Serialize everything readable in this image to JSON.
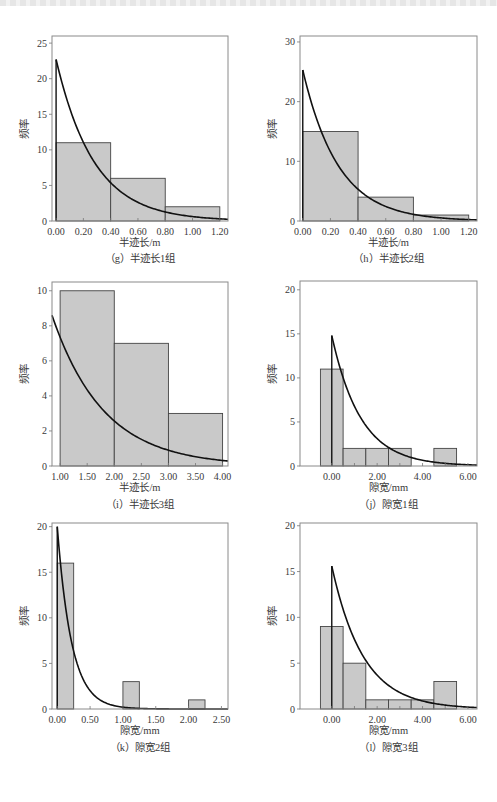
{
  "figure": {
    "ylabel": "频率",
    "panels_count": 6
  },
  "chart_data": [
    {
      "id": "g",
      "type": "bar",
      "title": "(g) 半迹长1组",
      "caption": "（g）半迹长1组",
      "xlabel": "半迹长/m",
      "ylabel": "频率",
      "xlim": [
        -0.03,
        1.26
      ],
      "ylim": [
        0,
        26
      ],
      "xticks": [
        0.0,
        0.2,
        0.4,
        0.6,
        0.8,
        1.0,
        1.2
      ],
      "xtick_labels": [
        "0.00",
        "0.20",
        "0.40",
        "0.60",
        "0.80",
        "1.00",
        "1.20"
      ],
      "yticks": [
        0,
        5,
        10,
        15,
        20,
        25
      ],
      "bins": [
        [
          0.0,
          0.4
        ],
        [
          0.4,
          0.8
        ],
        [
          0.8,
          1.2
        ]
      ],
      "values": [
        11,
        6,
        2
      ],
      "fit_curve": {
        "type": "exponential",
        "start_x": 0.0,
        "peak": 22.7,
        "rate": 3.6,
        "vertical_line_at": 0.0
      },
      "frame": {
        "x": 52,
        "y": 36,
        "w": 176,
        "h": 185
      },
      "caption_y": 262,
      "xlabel_y": 246
    },
    {
      "id": "h",
      "type": "bar",
      "title": "(h) 半迹长2组",
      "caption": "（h）半迹长2组",
      "xlabel": "半迹长/m",
      "ylabel": "频率",
      "xlim": [
        -0.02,
        1.26
      ],
      "ylim": [
        0,
        31
      ],
      "xticks": [
        0.0,
        0.2,
        0.4,
        0.6,
        0.8,
        1.0,
        1.2
      ],
      "xtick_labels": [
        "0.00",
        "0.20",
        "0.40",
        "0.60",
        "0.80",
        "1.00",
        "1.20"
      ],
      "yticks": [
        0,
        10,
        20,
        30
      ],
      "bins": [
        [
          0.0,
          0.4
        ],
        [
          0.4,
          0.8
        ],
        [
          0.8,
          1.2
        ]
      ],
      "values": [
        15,
        4,
        1
      ],
      "fit_curve": {
        "type": "exponential",
        "start_x": 0.0,
        "peak": 25.3,
        "rate": 3.9,
        "vertical_line_at": 0.0
      },
      "frame": {
        "x": 300,
        "y": 36,
        "w": 177,
        "h": 185
      },
      "caption_y": 262,
      "xlabel_y": 246
    },
    {
      "id": "i",
      "type": "bar",
      "title": "(i) 半迹长3组",
      "caption": "（i）半迹长3组",
      "xlabel": "半迹长/m",
      "ylabel": "频率",
      "xlim": [
        0.85,
        4.1
      ],
      "ylim": [
        0,
        10.5
      ],
      "xticks": [
        1.0,
        1.5,
        2.0,
        2.5,
        3.0,
        3.5,
        4.0
      ],
      "xtick_labels": [
        "1.00",
        "1.50",
        "2.00",
        "2.50",
        "3.00",
        "3.50",
        "4.00"
      ],
      "yticks": [
        0,
        2,
        4,
        6,
        8,
        10
      ],
      "bins": [
        [
          1.0,
          2.0
        ],
        [
          2.0,
          3.0
        ],
        [
          3.0,
          4.0
        ]
      ],
      "values": [
        10,
        7,
        3
      ],
      "fit_curve": {
        "type": "exponential",
        "start_x": 0.85,
        "peak": 8.6,
        "rate": 1.05,
        "vertical_line_at": null
      },
      "frame": {
        "x": 52,
        "y": 282,
        "w": 176,
        "h": 184
      },
      "caption_y": 508,
      "xlabel_y": 491
    },
    {
      "id": "j",
      "type": "bar",
      "title": "(j) 隙宽1组",
      "caption": "（j）隙宽1组",
      "xlabel": "隙宽/mm",
      "ylabel": "频率",
      "xlim": [
        -1.4,
        6.4
      ],
      "ylim": [
        0,
        21
      ],
      "xticks": [
        0.0,
        2.0,
        4.0,
        6.0
      ],
      "xtick_labels": [
        "0.00",
        "2.00",
        "4.00",
        "6.00"
      ],
      "minor_xticks": [
        1.0,
        3.0,
        5.0
      ],
      "yticks": [
        0,
        5,
        10,
        15,
        20
      ],
      "bins": [
        [
          -0.5,
          0.5
        ],
        [
          0.5,
          1.5
        ],
        [
          1.5,
          2.5
        ],
        [
          2.5,
          3.5
        ],
        [
          3.5,
          4.5
        ],
        [
          4.5,
          5.5
        ]
      ],
      "values": [
        11,
        2,
        2,
        2,
        0,
        2
      ],
      "fit_curve": {
        "type": "exponential",
        "start_x": 0.0,
        "peak": 14.8,
        "rate": 0.78,
        "vertical_line_at": 0.0
      },
      "frame": {
        "x": 300,
        "y": 281,
        "w": 177,
        "h": 185
      },
      "caption_y": 508,
      "xlabel_y": 491
    },
    {
      "id": "k",
      "type": "bar",
      "title": "(k) 隙宽2组",
      "caption": "（k）隙宽2组",
      "xlabel": "隙宽/mm",
      "ylabel": "频率",
      "xlim": [
        -0.08,
        2.6
      ],
      "ylim": [
        0,
        20.4
      ],
      "xticks": [
        0.0,
        0.5,
        1.0,
        1.5,
        2.0,
        2.5
      ],
      "xtick_labels": [
        "0.00",
        "0.50",
        "1.00",
        "1.50",
        "2.00",
        "2.50"
      ],
      "yticks": [
        0,
        5,
        10,
        15,
        20
      ],
      "bins": [
        [
          0.0,
          0.25
        ],
        [
          1.0,
          1.25
        ],
        [
          2.0,
          2.25
        ]
      ],
      "values": [
        16,
        3,
        1
      ],
      "fit_curve": {
        "type": "exponential",
        "start_x": 0.0,
        "peak": 20.0,
        "rate": 4.6,
        "vertical_line_at": 0.0
      },
      "frame": {
        "x": 52,
        "y": 523,
        "w": 176,
        "h": 186
      },
      "caption_y": 751,
      "xlabel_y": 734
    },
    {
      "id": "l",
      "type": "bar",
      "title": "(l) 隙宽3组",
      "caption": "（l）隙宽3组",
      "xlabel": "隙宽/mm",
      "ylabel": "频率",
      "xlim": [
        -1.4,
        6.4
      ],
      "ylim": [
        0,
        20.3
      ],
      "xticks": [
        0.0,
        2.0,
        4.0,
        6.0
      ],
      "xtick_labels": [
        "0.00",
        "2.00",
        "4.00",
        "6.00"
      ],
      "minor_xticks": [
        1.0,
        3.0,
        5.0
      ],
      "yticks": [
        0,
        5,
        10,
        15,
        20
      ],
      "bins": [
        [
          -0.5,
          0.5
        ],
        [
          0.5,
          1.5
        ],
        [
          1.5,
          2.5
        ],
        [
          2.5,
          3.5
        ],
        [
          3.5,
          4.5
        ],
        [
          4.5,
          5.5
        ]
      ],
      "values": [
        9,
        5,
        1,
        1,
        1,
        3
      ],
      "fit_curve": {
        "type": "exponential",
        "start_x": 0.0,
        "peak": 15.6,
        "rate": 0.72,
        "vertical_line_at": 0.0
      },
      "frame": {
        "x": 300,
        "y": 523,
        "w": 177,
        "h": 186
      },
      "caption_y": 751,
      "xlabel_y": 734
    }
  ]
}
